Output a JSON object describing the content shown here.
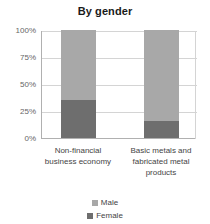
{
  "chart_data": {
    "type": "bar",
    "title": "By gender",
    "subtitle": "",
    "xlabel": "",
    "ylabel": "",
    "stacked": true,
    "stack_total": 100,
    "grid": true,
    "legend_position": "bottom",
    "ylim": [
      0,
      100
    ],
    "ytick_labels": [
      "100%",
      "75%",
      "50%",
      "25%",
      "0%"
    ],
    "ytick_values": [
      100,
      75,
      50,
      25,
      0
    ],
    "categories": [
      "Non-financial business economy",
      "Basic metals and fabricated metal products"
    ],
    "category_lines": [
      [
        "Non-financial",
        "business economy"
      ],
      [
        "Basic metals and",
        "fabricated metal",
        "products"
      ]
    ],
    "series": [
      {
        "name": "Male",
        "values": [
          65,
          84
        ],
        "color": "#a8a8a8"
      },
      {
        "name": "Female",
        "values": [
          35,
          16
        ],
        "color": "#6e6e6e"
      }
    ]
  },
  "legend": {
    "items": [
      {
        "label": "Male",
        "color": "#a8a8a8"
      },
      {
        "label": "Female",
        "color": "#6e6e6e"
      }
    ]
  },
  "colors": {
    "male": "#a8a8a8",
    "female": "#6e6e6e",
    "grid": "#d4d4d4",
    "axis": "#b0b0b0",
    "title_text": "#1a1a1a",
    "tick_text": "#666666",
    "label_text": "#444444",
    "background": "#ffffff"
  }
}
